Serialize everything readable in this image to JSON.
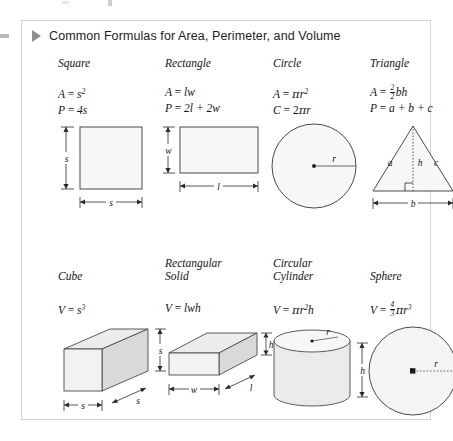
{
  "panel": {
    "title": "Common Formulas for Area, Perimeter, and Volume",
    "disclosure_icon": "triangle-right-icon",
    "border_color": "#d3d3d3",
    "accent_color": "#8e8e8e"
  },
  "rows": [
    {
      "cells": [
        {
          "name": "Square",
          "formulas": [
            "A = s²",
            "P = 4s"
          ],
          "figure": "square-figure",
          "labels": [
            "s",
            "s"
          ]
        },
        {
          "name": "Rectangle",
          "formulas": [
            "A = lw",
            "P = 2l + 2w"
          ],
          "figure": "rectangle-figure",
          "labels": [
            "w",
            "l"
          ]
        },
        {
          "name": "Circle",
          "formulas": [
            "A = πr²",
            "C = 2πr"
          ],
          "figure": "circle-figure",
          "labels": [
            "r"
          ]
        },
        {
          "name": "Triangle",
          "formulas": [
            "A = ½bh",
            "P = a + b + c"
          ],
          "figure": "triangle-figure",
          "labels": [
            "a",
            "h",
            "c",
            "b"
          ]
        }
      ]
    },
    {
      "cells": [
        {
          "name": "Cube",
          "formulas": [
            "V = s³"
          ],
          "figure": "cube-figure",
          "labels": [
            "s",
            "s",
            "s"
          ]
        },
        {
          "name": "Rectangular Solid",
          "formulas": [
            "V = lwh"
          ],
          "figure": "rectangular-solid-figure",
          "labels": [
            "h",
            "l",
            "w"
          ]
        },
        {
          "name": "Circular Cylinder",
          "formulas": [
            "V = πr²h"
          ],
          "figure": "circular-cylinder-figure",
          "labels": [
            "r",
            "h"
          ]
        },
        {
          "name": "Sphere",
          "formulas": [
            "V = (4/3)πr³"
          ],
          "figure": "sphere-figure",
          "labels": [
            "r"
          ]
        }
      ]
    }
  ],
  "text": {
    "square": "Square",
    "rectangle": "Rectangle",
    "circle": "Circle",
    "triangle": "Triangle",
    "cube": "Cube",
    "rect_solid_l1": "Rectangular",
    "rect_solid_l2": "Solid",
    "circ_cyl_l1": "Circular",
    "circ_cyl_l2": "Cylinder",
    "sphere": "Sphere",
    "lbl_s": "s",
    "lbl_w": "w",
    "lbl_l": "l",
    "lbl_r": "r",
    "lbl_h": "h",
    "lbl_a": "a",
    "lbl_b": "b",
    "lbl_c": "c",
    "eq": "=",
    "plus": "+",
    "A": "A",
    "P": "P",
    "C": "C",
    "V": "V",
    "pi": "π",
    "four": "4",
    "two": "2",
    "three": "3",
    "sq_A_rest": "s",
    "sq_P_rest": "4s",
    "rect_A_rest": "lw",
    "rect_P_rest": "2l + 2w",
    "circ_A_rest": "r",
    "circ_C_rest": "2",
    "tri_P_rest": "a + b + c",
    "tri_A_rest": "bh",
    "cube_V_rest": "s",
    "rs_V_rest": "lwh",
    "cyl_V_rest": "r",
    "cyl_V_tail": "h",
    "sph_V_rest": "r"
  }
}
